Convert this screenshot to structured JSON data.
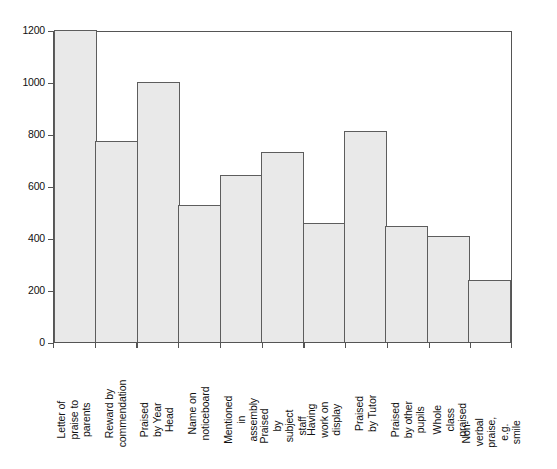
{
  "chart_data": {
    "type": "bar",
    "title": "",
    "xlabel": "",
    "ylabel": "",
    "ylim": [
      0,
      1200
    ],
    "yticks": [
      0,
      200,
      400,
      600,
      800,
      1000,
      1200
    ],
    "ytick_labels": [
      "0",
      "200",
      "400",
      "600",
      "800",
      "1000",
      "1200"
    ],
    "grid": false,
    "legend": null,
    "bar_fill_color": "#e9e9e9",
    "bar_edge_color": "#5d5d5d",
    "categories": [
      "Letter of praise to\nparents",
      "Reward by\ncommendation",
      "Praised by Year\nHead",
      "Name on\nnoticeboard",
      "Mentioned in\nassembly",
      "Praised by subject\nstaff",
      "Having work on\ndisplay",
      "Praised by Tutor",
      "Praised by other\npupils",
      "Whole class praised",
      "Non-verbal praise,\ne.g. smile"
    ],
    "values": [
      1200,
      772,
      1001,
      528,
      641,
      729,
      456,
      812,
      448,
      406,
      239
    ]
  }
}
